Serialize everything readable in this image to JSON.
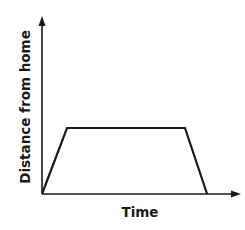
{
  "chart_data": {
    "type": "line",
    "title": "",
    "xlabel": "Time",
    "ylabel": "Distance from home",
    "grid": false,
    "legend": null,
    "x_ticks": [],
    "y_ticks": [],
    "series": [
      {
        "name": "Distance from home over time",
        "description": "Trapezoid: increase from home, constant distance, return to home",
        "points_normalized": [
          {
            "x": 0.0,
            "y": 0.0
          },
          {
            "x": 0.127,
            "y": 0.373
          },
          {
            "x": 0.726,
            "y": 0.373
          },
          {
            "x": 0.838,
            "y": 0.0
          }
        ]
      }
    ]
  },
  "colors": {
    "line": "#1a1a1a",
    "axis": "#1a1a1a",
    "background": "#ffffff"
  }
}
